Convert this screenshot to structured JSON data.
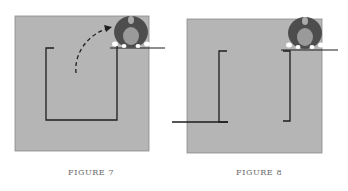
{
  "figures": [
    {
      "id": "figure-7",
      "caption": "FIGURE 7"
    },
    {
      "id": "figure-8",
      "caption": "FIGURE 8"
    }
  ],
  "colors": {
    "board": "#b5b5b5",
    "board_border": "#8a8a8a",
    "line": "#1e1e1e",
    "figure_dark": "#4d4d4d",
    "figure_head": "#9a9a9a",
    "caption": "#6a6a6a"
  }
}
